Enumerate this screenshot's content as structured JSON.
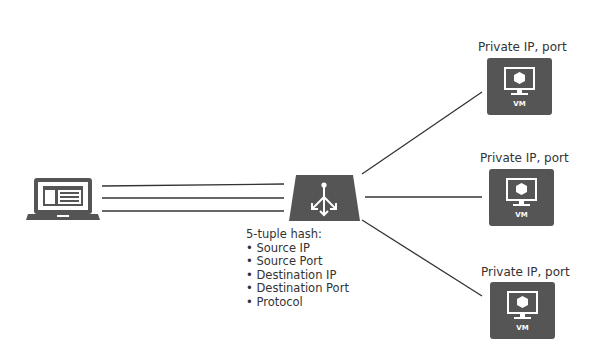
{
  "diagram": {
    "client": {
      "icon": "laptop-icon"
    },
    "load_balancer": {
      "icon": "load-balancer-icon"
    },
    "hash_info": {
      "title": "5-tuple hash:",
      "fields": [
        "Source IP",
        "Source Port",
        "Destination IP",
        "Destination Port",
        "Protocol"
      ]
    },
    "backends": [
      {
        "label": "Private IP, port",
        "icon_text": "VM"
      },
      {
        "label": "Private IP, port",
        "icon_text": "VM"
      },
      {
        "label": "Private IP, port",
        "icon_text": "VM"
      }
    ],
    "colors": {
      "icon_fill": "#555555",
      "line": "#333333",
      "background": "#ffffff"
    }
  }
}
